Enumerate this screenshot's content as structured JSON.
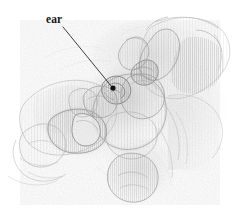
{
  "figure": {
    "kind": "pencil-anatomical-illustration",
    "width": 238,
    "height": 217,
    "background_color": "#ffffff",
    "ink_color": "#6e6e6e",
    "dark_ink_color": "#1a1a1a",
    "mid_tone_color": "#a8a8a8",
    "light_tone_color": "#dcdcdc"
  },
  "annotations": [
    {
      "id": "ear",
      "label": "ear",
      "label_x": 46,
      "label_y": 23,
      "leader_start_x": 63,
      "leader_start_y": 27,
      "leader_end_x": 112,
      "leader_end_y": 87,
      "dot_x": 113,
      "dot_y": 88,
      "dot_radius": 2.6,
      "line_color": "#2a2a2a",
      "line_width": 0.9
    }
  ],
  "drawing": {
    "upper_hand": {
      "name": "upper-right-hand",
      "description": "hand entering from upper right, fingers curling down toward center"
    },
    "lower_hand": {
      "name": "lower-left-hand",
      "description": "hand from lower left, thumb tip with nail pressing toward center"
    },
    "presenting_part": {
      "name": "fetal-presenting-part",
      "description": "rounded head-like form at center with ear landmark"
    },
    "forearm": {
      "name": "forearm-wrist",
      "description": "wrist and forearm extending to lower right"
    }
  }
}
